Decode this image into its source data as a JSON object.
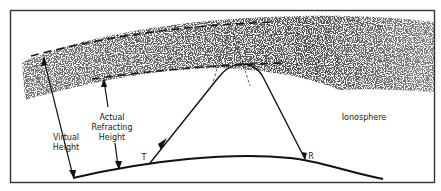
{
  "diagram": {
    "labels": {
      "virtual_height_line1": "Virtual",
      "virtual_height_line2": "Height",
      "actual_line1": "Actual",
      "actual_line2": "Refracting",
      "actual_line3": "Height",
      "transmitter": "T",
      "receiver": "R",
      "ionosphere": "Ionosphere"
    },
    "colors": {
      "line": "#1a1a1a",
      "border": "#333333",
      "stipple": "#555555",
      "background": "#ffffff"
    }
  }
}
